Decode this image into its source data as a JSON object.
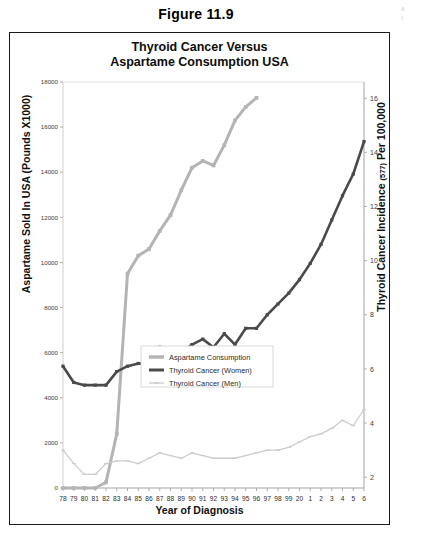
{
  "figure": {
    "caption": "Figure 11.9",
    "margin_note_line1": "a",
    "margin_note_line2": "i"
  },
  "chart_data": {
    "type": "line",
    "title": "Thyroid Cancer Versus Aspartame Consumption USA",
    "title_line1": "Thyroid Cancer Versus",
    "title_line2": "Aspartame Consumption USA",
    "xlabel": "Year of Diagnosis",
    "ylabel": "Aspartame Sold In USA (Pounds X1000)",
    "ylabel_right_main": "Thyroid Cancer Incidence",
    "ylabel_right_small": "(577)",
    "ylabel_right_tail": "Per 100,000",
    "grid": false,
    "legend_position": "center",
    "categories": [
      "78",
      "79",
      "80",
      "81",
      "82",
      "83",
      "84",
      "85",
      "86",
      "87",
      "88",
      "89",
      "90",
      "91",
      "92",
      "93",
      "94",
      "95",
      "96",
      "97",
      "98",
      "99",
      "20",
      "1",
      "2",
      "3",
      "4",
      "5",
      "6"
    ],
    "y_left": {
      "label": "Aspartame Sold In USA (Pounds X1000)",
      "ticks": [
        0,
        2000,
        4000,
        6000,
        8000,
        10000,
        12000,
        14000,
        16000,
        18000
      ],
      "ylim": [
        0,
        18000
      ]
    },
    "y_right": {
      "label": "Thyroid Cancer Incidence (577) Per 100,000",
      "ticks": [
        2,
        4,
        6,
        8,
        10,
        12,
        14,
        16
      ],
      "ylim": [
        1.6,
        16.6
      ]
    },
    "series": [
      {
        "name": "Aspartame Consumption",
        "axis": "left",
        "color": "#b4b4b4",
        "width": 3.0,
        "marker": "square",
        "x": [
          "78",
          "79",
          "80",
          "81",
          "82",
          "83",
          "84",
          "85",
          "86",
          "87",
          "88",
          "89",
          "90",
          "91",
          "92",
          "93",
          "94",
          "95",
          "96"
        ],
        "values": [
          0,
          0,
          0,
          0,
          250,
          2400,
          9500,
          10300,
          10600,
          11400,
          12100,
          13200,
          14200,
          14500,
          14300,
          15200,
          16300,
          16900,
          17300
        ]
      },
      {
        "name": "Thyroid Cancer (Women)",
        "axis": "right",
        "color": "#4a4a4a",
        "width": 2.6,
        "marker": "square",
        "x": [
          "78",
          "79",
          "80",
          "81",
          "82",
          "83",
          "84",
          "85",
          "86",
          "87",
          "88",
          "89",
          "90",
          "91",
          "92",
          "93",
          "94",
          "95",
          "96",
          "97",
          "98",
          "99",
          "20",
          "1",
          "2",
          "3",
          "4",
          "5",
          "6"
        ],
        "values": [
          6.1,
          5.5,
          5.4,
          5.4,
          5.4,
          5.9,
          6.1,
          6.2,
          6.2,
          6.8,
          6.4,
          6.6,
          6.9,
          7.1,
          6.8,
          7.3,
          6.9,
          7.5,
          7.5,
          8.0,
          8.4,
          8.8,
          9.3,
          9.9,
          10.6,
          11.5,
          12.4,
          13.2,
          14.4
        ]
      },
      {
        "name": "Thyroid Cancer (Men)",
        "axis": "right",
        "color": "#cccccc",
        "width": 1.3,
        "marker": "tick",
        "x": [
          "78",
          "79",
          "80",
          "81",
          "82",
          "83",
          "84",
          "85",
          "86",
          "87",
          "88",
          "89",
          "90",
          "91",
          "92",
          "93",
          "94",
          "95",
          "96",
          "97",
          "98",
          "99",
          "20",
          "1",
          "2",
          "3",
          "4",
          "5",
          "6"
        ],
        "values": [
          3.0,
          2.5,
          2.1,
          2.1,
          2.5,
          2.6,
          2.6,
          2.5,
          2.7,
          2.9,
          2.8,
          2.7,
          2.9,
          2.8,
          2.7,
          2.7,
          2.7,
          2.8,
          2.9,
          3.0,
          3.0,
          3.1,
          3.3,
          3.5,
          3.6,
          3.8,
          4.1,
          3.9,
          4.5
        ]
      }
    ],
    "legend": [
      {
        "label": "Aspartame Consumption",
        "color": "#b4b4b4",
        "width": 3.4
      },
      {
        "label": "Thyroid Cancer (Women)",
        "color": "#4a4a4a",
        "width": 3.0
      },
      {
        "label": "Thyroid Cancer (Men)",
        "color": "#c6c6c6",
        "width": 1.2
      }
    ]
  }
}
